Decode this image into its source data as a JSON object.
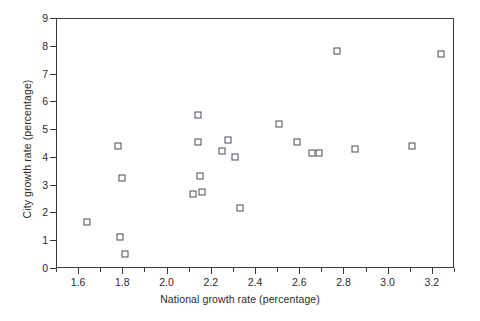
{
  "chart_data": {
    "type": "scatter",
    "title": "",
    "xlabel": "National growth rate (percentage)",
    "ylabel": "City growth rate (percentage)",
    "xlim": [
      1.5,
      3.3
    ],
    "ylim": [
      0,
      9
    ],
    "xticks": [
      1.6,
      1.8,
      2.0,
      2.2,
      2.4,
      2.6,
      2.8,
      3.0,
      3.2
    ],
    "xticklabels": [
      "1.6",
      "1.8",
      "2.0",
      "2.2",
      "2.4",
      "2.6",
      "2.8",
      "3.0",
      "3.2"
    ],
    "xminorticks": [
      1.5,
      1.7,
      1.9,
      2.1,
      2.3,
      2.5,
      2.7,
      2.9,
      3.1,
      3.3
    ],
    "yticks": [
      0,
      1,
      2,
      3,
      4,
      5,
      6,
      7,
      8,
      9
    ],
    "yticklabels": [
      "0",
      "1",
      "2",
      "3",
      "4",
      "5",
      "6",
      "7",
      "8",
      "9"
    ],
    "grid": false,
    "legend": null,
    "marker": "open-square",
    "marker_color": "#4a4a56",
    "points": [
      {
        "x": 1.64,
        "y": 1.65
      },
      {
        "x": 1.78,
        "y": 4.4
      },
      {
        "x": 1.8,
        "y": 3.25
      },
      {
        "x": 1.79,
        "y": 1.1
      },
      {
        "x": 1.81,
        "y": 0.5
      },
      {
        "x": 2.12,
        "y": 2.65
      },
      {
        "x": 2.14,
        "y": 4.55
      },
      {
        "x": 2.14,
        "y": 5.5
      },
      {
        "x": 2.15,
        "y": 3.3
      },
      {
        "x": 2.16,
        "y": 2.75
      },
      {
        "x": 2.25,
        "y": 4.2
      },
      {
        "x": 2.28,
        "y": 4.6
      },
      {
        "x": 2.31,
        "y": 4.0
      },
      {
        "x": 2.33,
        "y": 2.15
      },
      {
        "x": 2.51,
        "y": 5.2
      },
      {
        "x": 2.59,
        "y": 4.55
      },
      {
        "x": 2.66,
        "y": 4.15
      },
      {
        "x": 2.69,
        "y": 4.15
      },
      {
        "x": 2.77,
        "y": 7.8
      },
      {
        "x": 2.85,
        "y": 4.3
      },
      {
        "x": 3.11,
        "y": 4.4
      },
      {
        "x": 3.24,
        "y": 7.7
      }
    ]
  }
}
